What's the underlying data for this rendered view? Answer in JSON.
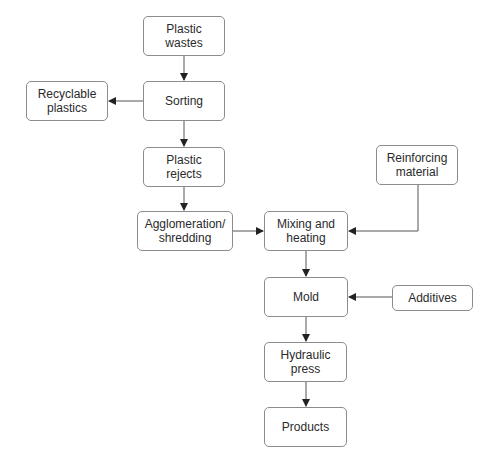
{
  "diagram": {
    "type": "flowchart",
    "nodes": [
      {
        "id": "plastic_wastes",
        "label": "Plastic\nwastes"
      },
      {
        "id": "sorting",
        "label": "Sorting"
      },
      {
        "id": "recyclable",
        "label": "Recyclable\nplastics"
      },
      {
        "id": "plastic_rejects",
        "label": "Plastic\nrejects"
      },
      {
        "id": "agglomeration",
        "label": "Agglomeration/\nshredding"
      },
      {
        "id": "mixing",
        "label": "Mixing and\nheating"
      },
      {
        "id": "reinforcing",
        "label": "Reinforcing\nmaterial"
      },
      {
        "id": "mold",
        "label": "Mold"
      },
      {
        "id": "additives",
        "label": "Additives"
      },
      {
        "id": "hydraulic",
        "label": "Hydraulic\npress"
      },
      {
        "id": "products",
        "label": "Products"
      }
    ],
    "edges": [
      {
        "from": "plastic_wastes",
        "to": "sorting"
      },
      {
        "from": "sorting",
        "to": "recyclable"
      },
      {
        "from": "sorting",
        "to": "plastic_rejects"
      },
      {
        "from": "plastic_rejects",
        "to": "agglomeration"
      },
      {
        "from": "agglomeration",
        "to": "mixing"
      },
      {
        "from": "reinforcing",
        "to": "mixing"
      },
      {
        "from": "mixing",
        "to": "mold"
      },
      {
        "from": "additives",
        "to": "mold"
      },
      {
        "from": "mold",
        "to": "hydraulic"
      },
      {
        "from": "hydraulic",
        "to": "products"
      }
    ]
  }
}
